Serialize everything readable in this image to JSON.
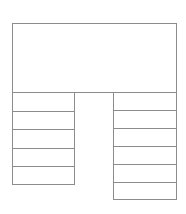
{
  "diagram": {
    "title": "",
    "type": "pi-shaped-table-outline",
    "background_color": "#ffffff",
    "line_color": "#8c8c8c",
    "fill_color": "#ffffff",
    "canvas": {
      "width": 186,
      "height": 214
    },
    "header": {
      "label": "",
      "x": 12,
      "y": 23,
      "width": 165,
      "height": 70
    },
    "left_column": {
      "label": "",
      "x": 12,
      "y": 92,
      "width": 63,
      "row_height": 18.6,
      "rows": [
        {
          "label": ""
        },
        {
          "label": ""
        },
        {
          "label": ""
        },
        {
          "label": ""
        },
        {
          "label": ""
        }
      ]
    },
    "right_column": {
      "label": "",
      "x": 113,
      "y": 92,
      "width": 64,
      "row_height": 18,
      "rows": [
        {
          "label": ""
        },
        {
          "label": ""
        },
        {
          "label": ""
        },
        {
          "label": ""
        },
        {
          "label": ""
        },
        {
          "label": ""
        }
      ]
    }
  }
}
